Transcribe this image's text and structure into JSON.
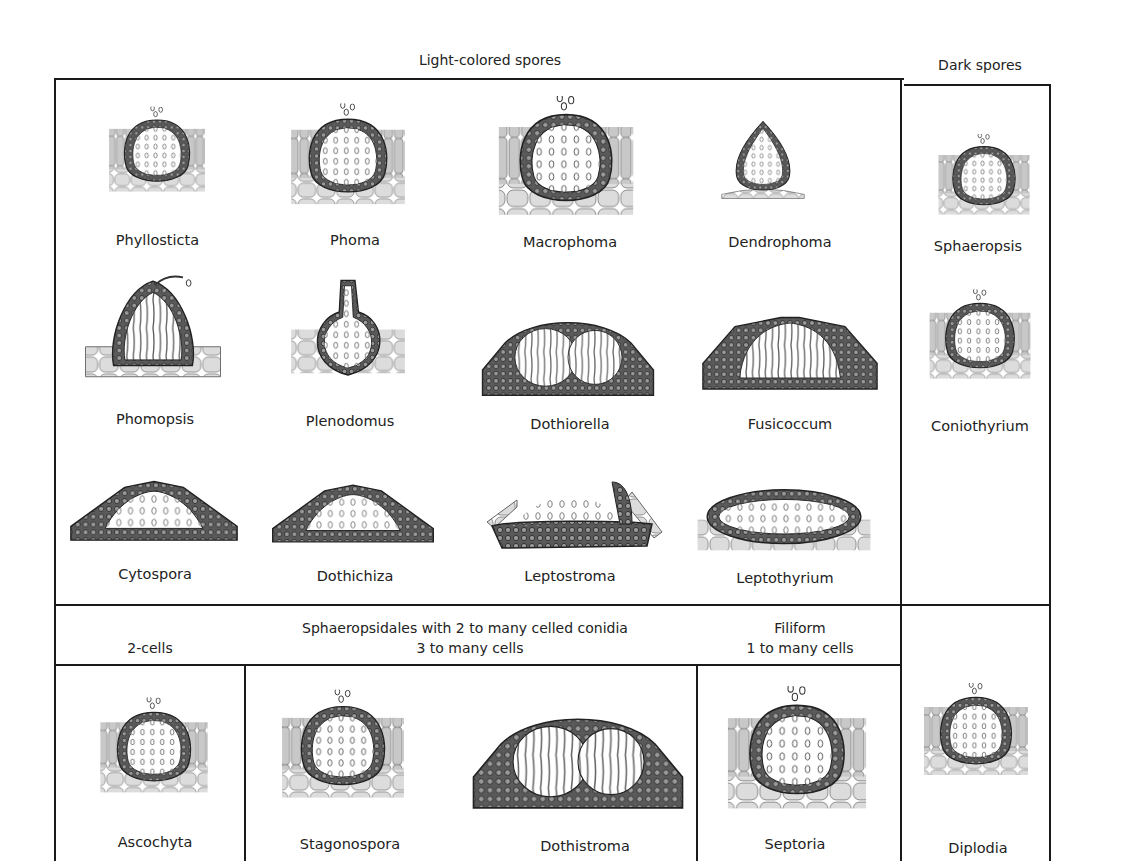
{
  "headers": {
    "light_spores": "Light-colored spores",
    "dark_spores": "Dark spores",
    "multicell_title": "Sphaeropsidales with 2 to many celled conidia",
    "two_cells": "2-cells",
    "three_many": "3 to many cells",
    "filiform": "Filiform",
    "one_many": "1 to many cells"
  },
  "light_rows": [
    [
      {
        "name": "Phyllosticta",
        "shape": "embedded-round"
      },
      {
        "name": "Phoma",
        "shape": "embedded-round"
      },
      {
        "name": "Macrophoma",
        "shape": "embedded-round"
      },
      {
        "name": "Dendrophoma",
        "shape": "teardrop-superficial"
      }
    ],
    [
      {
        "name": "Phomopsis",
        "shape": "erumpent-cone"
      },
      {
        "name": "Plenodomus",
        "shape": "long-neck"
      },
      {
        "name": "Dothiorella",
        "shape": "stroma-double"
      },
      {
        "name": "Fusicoccum",
        "shape": "stroma-open"
      }
    ],
    [
      {
        "name": "Cytospora",
        "shape": "stroma-flat"
      },
      {
        "name": "Dothichiza",
        "shape": "stroma-flat"
      },
      {
        "name": "Leptostroma",
        "shape": "cup-flat"
      },
      {
        "name": "Leptothyrium",
        "shape": "lens-flat"
      }
    ]
  ],
  "dark_column": [
    {
      "name": "Sphaeropsis",
      "shape": "embedded-round"
    },
    {
      "name": "Coniothyrium",
      "shape": "embedded-round"
    }
  ],
  "bottom_row": [
    {
      "name": "Ascochyta",
      "shape": "embedded-round"
    },
    {
      "name": "Stagonospora",
      "shape": "embedded-round"
    },
    {
      "name": "Dothistroma",
      "shape": "stroma-double"
    },
    {
      "name": "Septoria",
      "shape": "embedded-round"
    },
    {
      "name": "Diplodia",
      "shape": "embedded-round"
    }
  ],
  "colors": {
    "ink": "#1a1a1a",
    "cell_fill": "#d9d9d9",
    "wall": "#3a3a3a",
    "background": "#ffffff"
  }
}
